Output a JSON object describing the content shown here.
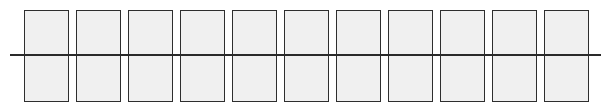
{
  "diagram": {
    "type": "row-of-rectangles-with-horizontal-line",
    "cell_count": 11,
    "cells": [
      {
        "index": 1,
        "x": 24
      },
      {
        "index": 2,
        "x": 76
      },
      {
        "index": 3,
        "x": 128
      },
      {
        "index": 4,
        "x": 180
      },
      {
        "index": 5,
        "x": 232
      },
      {
        "index": 6,
        "x": 284
      },
      {
        "index": 7,
        "x": 336
      },
      {
        "index": 8,
        "x": 388
      },
      {
        "index": 9,
        "x": 440
      },
      {
        "index": 10,
        "x": 492
      },
      {
        "index": 11,
        "x": 544
      }
    ],
    "cell_fill": "#f0f0f0",
    "stroke": "#2e2e2e",
    "line": {
      "x1": 10,
      "x2": 601,
      "y": 55
    }
  }
}
